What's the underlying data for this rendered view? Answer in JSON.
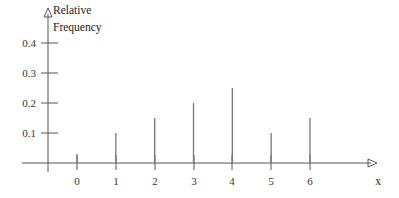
{
  "chart_data": {
    "type": "bar",
    "title": "",
    "subtitle": "",
    "xlabel": "x",
    "ylabel_lines": [
      "Relative",
      "Frequency"
    ],
    "ylabel": "Relative Frequency",
    "categories": [
      "0",
      "1",
      "2",
      "3",
      "4",
      "5",
      "6"
    ],
    "x": [
      0,
      1,
      2,
      3,
      4,
      5,
      6
    ],
    "values": [
      0.03,
      0.1,
      0.15,
      0.2,
      0.25,
      0.1,
      0.15
    ],
    "ytick_labels": [
      "0.1",
      "0.2",
      "0.3",
      "0.4"
    ],
    "ytick_values": [
      0.1,
      0.2,
      0.3,
      0.4
    ],
    "xtick_labels": [
      "0",
      "1",
      "2",
      "3",
      "4",
      "5",
      "6"
    ],
    "ylim": [
      0,
      0.45
    ],
    "xlim": [
      -1,
      7.6
    ],
    "grid": false,
    "legend": false,
    "legend_position": "none",
    "style": "stem-plot-with-arrow-axes",
    "colors": {
      "background": "#ffffff",
      "axis": "#555555",
      "stem": "#777777",
      "text": "#222222"
    }
  }
}
